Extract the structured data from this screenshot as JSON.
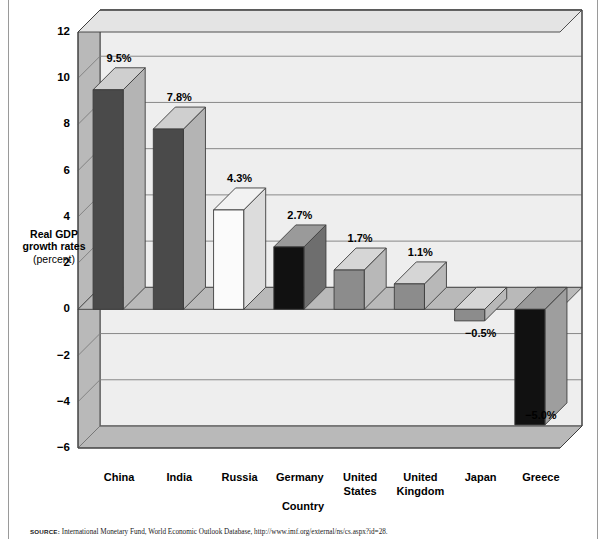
{
  "chart_data": {
    "type": "bar",
    "title": "",
    "xlabel": "Country",
    "ylabel": "Real GDP growth rates",
    "ylabel_unit": "(percent)",
    "ylim": [
      -6,
      12
    ],
    "ytick_step": 2,
    "yticks": [
      "12",
      "10",
      "8",
      "6",
      "4",
      "2",
      "0",
      "−2",
      "−4",
      "−6"
    ],
    "grid": true,
    "legend": "none",
    "style": "3d-bar",
    "categories": [
      "China",
      "India",
      "Russia",
      "Germany",
      "United States",
      "United Kingdom",
      "Japan",
      "Greece"
    ],
    "category_lines": [
      [
        "China"
      ],
      [
        "India"
      ],
      [
        "Russia"
      ],
      [
        "Germany"
      ],
      [
        "United",
        "States"
      ],
      [
        "United",
        "Kingdom"
      ],
      [
        "Japan"
      ],
      [
        "Greece"
      ]
    ],
    "values": [
      9.5,
      7.8,
      4.3,
      2.7,
      1.7,
      1.1,
      -0.5,
      -5.0
    ],
    "value_labels": [
      "9.5%",
      "7.8%",
      "4.3%",
      "2.7%",
      "1.7%",
      "1.1%",
      "−0.5%",
      "−5.0%"
    ],
    "bar_colors": [
      "#4a4a4a",
      "#4a4a4a",
      "#fbfbfb",
      "#111111",
      "#8c8c8c",
      "#8c8c8c",
      "#8c8c8c",
      "#111111"
    ],
    "bar_top_colors": [
      "#cfcfcf",
      "#cfcfcf",
      "#f2f2f2",
      "#9a9a9a",
      "#d6d6d6",
      "#d6d6d6",
      "#d6d6d6",
      "#9a9a9a"
    ],
    "bar_side_colors": [
      "#b4b4b4",
      "#b4b4b4",
      "#dcdcdc",
      "#6e6e6e",
      "#b8b8b8",
      "#b8b8b8",
      "#b8b8b8",
      "#9e9e9e"
    ]
  },
  "colors": {
    "plot_face": "#eeeeee",
    "floor": "#b9b9b9",
    "wall_left": "#b9b9b9",
    "grid": "#7d7d7d",
    "outline": "#3d3d3d",
    "page_rule": "#9a9a9a"
  },
  "source": {
    "label": "SOURCE:",
    "text": "International Monetary Fund, World Economic Outlook Database, http://www.imf.org/external/ns/cs.aspx?id=28."
  }
}
